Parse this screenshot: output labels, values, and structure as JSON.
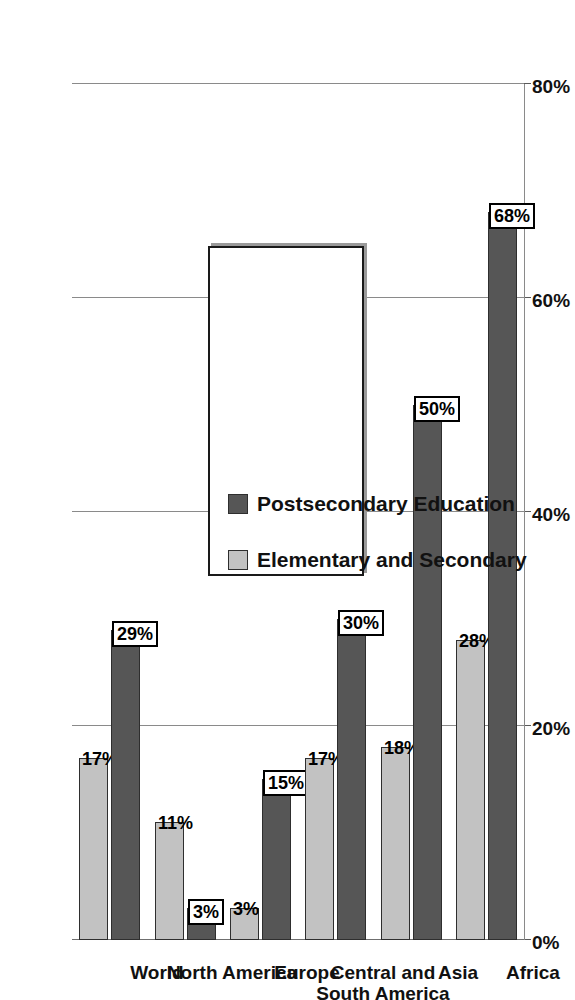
{
  "chart_data": {
    "type": "bar",
    "orientation": "horizontal",
    "title": "",
    "xlabel": "",
    "ylabel": "",
    "categories": [
      "World",
      "North America",
      "Europe",
      "Central and South America",
      "Asia",
      "Africa"
    ],
    "series": [
      {
        "name": "Elementary and Secondary",
        "color": "#c2c2c2",
        "values": [
          17,
          11,
          3,
          17,
          18,
          28
        ],
        "labels": [
          "17%",
          "11%",
          "3%",
          "17%",
          "18%",
          "28%"
        ],
        "label_boxed": false
      },
      {
        "name": "Postsecondary Education",
        "color": "#565656",
        "values": [
          29,
          3,
          15,
          30,
          50,
          68
        ],
        "labels": [
          "29%",
          "3%",
          "15%",
          "30%",
          "50%",
          "68%"
        ],
        "label_boxed": true
      }
    ],
    "axis": {
      "ticks": [
        0,
        20,
        40,
        60,
        80
      ],
      "tick_labels": [
        "0%",
        "20%",
        "40%",
        "60%",
        "80%"
      ],
      "min": 0,
      "max": 80,
      "grid": true
    },
    "legend": {
      "position": "inside-left",
      "entries": [
        {
          "label": "Elementary and Secondary",
          "color": "#c2c2c2"
        },
        {
          "label": "Postsecondary Education",
          "color": "#565656"
        }
      ]
    }
  }
}
